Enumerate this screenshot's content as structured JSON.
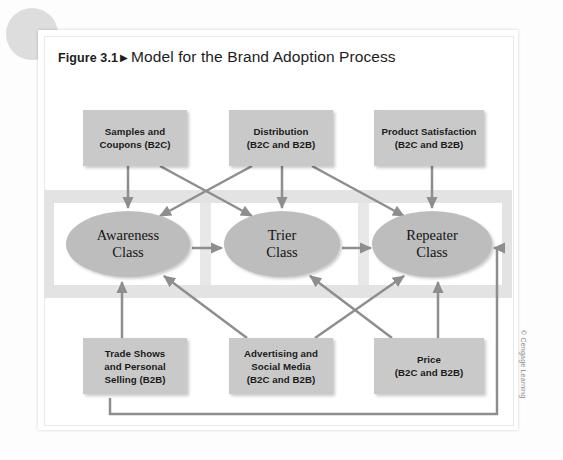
{
  "figure": {
    "number": "Figure 3.1",
    "marker": "▶",
    "title": "Model for the Brand Adoption Process"
  },
  "copyright": "© Cengage Learning",
  "colors": {
    "box_fill": "#c9c9c9",
    "ellipse_fill": "#bdbdbd",
    "band_fill": "#e3e3e3",
    "arrow": "#8e8e8e",
    "card": "#ffffff",
    "page": "#fdfdfd"
  },
  "diagram": {
    "type": "flow",
    "top_drivers": [
      {
        "id": "samples",
        "label": "Samples and\nCoupons (B2C)",
        "x": 83,
        "y": 110,
        "w": 104,
        "h": 56
      },
      {
        "id": "distribution",
        "label": "Distribution\n(B2C and B2B)",
        "x": 229,
        "y": 110,
        "w": 104,
        "h": 56
      },
      {
        "id": "satisfaction",
        "label": "Product Satisfaction\n(B2C and B2B)",
        "x": 374,
        "y": 110,
        "w": 110,
        "h": 56
      }
    ],
    "classes": [
      {
        "id": "awareness",
        "label": "Awareness\nClass",
        "cx": 128,
        "cy": 244,
        "rx": 62,
        "ry": 33
      },
      {
        "id": "trier",
        "label": "Trier\nClass",
        "cx": 282,
        "cy": 244,
        "rx": 58,
        "ry": 33
      },
      {
        "id": "repeater",
        "label": "Repeater\nClass",
        "cx": 432,
        "cy": 244,
        "rx": 60,
        "ry": 33
      }
    ],
    "bottom_drivers": [
      {
        "id": "tradeshows",
        "label": "Trade Shows\nand Personal\nSelling (B2B)",
        "x": 83,
        "y": 338,
        "w": 104,
        "h": 56
      },
      {
        "id": "advertising",
        "label": "Advertising and\nSocial Media\n(B2C and B2B)",
        "x": 229,
        "y": 338,
        "w": 104,
        "h": 56
      },
      {
        "id": "price",
        "label": "Price\n(B2C and B2B)",
        "x": 374,
        "y": 338,
        "w": 110,
        "h": 56
      }
    ],
    "edges": [
      {
        "from": "samples",
        "to": "awareness"
      },
      {
        "from": "samples",
        "to": "trier"
      },
      {
        "from": "distribution",
        "to": "awareness"
      },
      {
        "from": "distribution",
        "to": "trier"
      },
      {
        "from": "distribution",
        "to": "repeater"
      },
      {
        "from": "satisfaction",
        "to": "repeater"
      },
      {
        "from": "awareness",
        "to": "trier"
      },
      {
        "from": "trier",
        "to": "repeater"
      },
      {
        "from": "tradeshows",
        "to": "awareness"
      },
      {
        "from": "advertising",
        "to": "awareness"
      },
      {
        "from": "advertising",
        "to": "repeater"
      },
      {
        "from": "price",
        "to": "trier"
      },
      {
        "from": "price",
        "to": "repeater"
      },
      {
        "from": "tradeshows",
        "to": "repeater",
        "style": "feedback-loop"
      }
    ]
  }
}
